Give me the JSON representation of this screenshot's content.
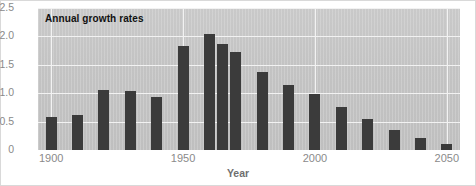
{
  "chart_data": {
    "type": "bar",
    "title": "Annual growth rates",
    "xlabel": "Year",
    "ylabel": "",
    "categories": [
      1900,
      1910,
      1920,
      1930,
      1940,
      1950,
      1960,
      1965,
      1970,
      1980,
      1990,
      2000,
      2010,
      2020,
      2030,
      2040,
      2050
    ],
    "values": [
      0.58,
      0.61,
      1.06,
      1.04,
      0.93,
      1.83,
      2.04,
      1.87,
      1.72,
      1.37,
      1.15,
      0.98,
      0.76,
      0.55,
      0.36,
      0.21,
      0.1
    ],
    "xlim": [
      1895,
      2055
    ],
    "ylim": [
      0,
      2.5
    ],
    "ytick_labels": [
      "2.5",
      "2.0",
      "1.5",
      "1.0",
      "0.5",
      "0"
    ],
    "ytick_values": [
      2.5,
      2.0,
      1.5,
      1.0,
      0.5,
      0
    ],
    "xtick_labels": [
      "1900",
      "1950",
      "2000",
      "2050"
    ],
    "xtick_values": [
      1900,
      1950,
      2000,
      2050
    ],
    "grid": "horizontal-and-vertical",
    "legend": "none",
    "bar_color": "#3b3b3b",
    "plot_background": "#c4c4c4",
    "gridline_color": "#f2f2f2",
    "tick_label_color": "#8a8a8a"
  }
}
